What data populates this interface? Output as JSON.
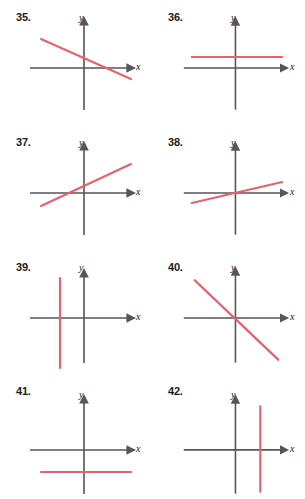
{
  "page": {
    "width": 305,
    "height": 499,
    "background": "#ffffff"
  },
  "style": {
    "line_color": "#e8606b",
    "axis_color": "#55555a",
    "text_color": "#1b1b1b",
    "axis_label_color": "#222222"
  },
  "axis_labels": {
    "x": "x",
    "y": "y"
  },
  "panels": [
    {
      "number": "35.",
      "col": 0,
      "row": 0,
      "origin": {
        "x": 84,
        "y": 68
      },
      "line_type": "oblique",
      "slope_sign": "negative",
      "line": {
        "x1": 41,
        "y1": 39,
        "x2": 131,
        "y2": 79
      }
    },
    {
      "number": "36.",
      "col": 1,
      "row": 0,
      "origin": {
        "x": 236,
        "y": 68
      },
      "line_type": "horizontal",
      "slope_sign": "zero",
      "line": {
        "x1": 192,
        "y1": 57,
        "x2": 283,
        "y2": 57
      }
    },
    {
      "number": "37.",
      "col": 0,
      "row": 1,
      "origin": {
        "x": 84,
        "y": 193
      },
      "line_type": "oblique",
      "slope_sign": "positive",
      "line": {
        "x1": 41,
        "y1": 206,
        "x2": 131,
        "y2": 164
      }
    },
    {
      "number": "38.",
      "col": 1,
      "row": 1,
      "origin": {
        "x": 236,
        "y": 193
      },
      "line_type": "oblique",
      "slope_sign": "positive-shallow",
      "line": {
        "x1": 192,
        "y1": 203,
        "x2": 283,
        "y2": 182
      }
    },
    {
      "number": "39.",
      "col": 0,
      "row": 2,
      "origin": {
        "x": 84,
        "y": 318
      },
      "line_type": "vertical",
      "slope_sign": "undefined",
      "line": {
        "x1": 60,
        "y1": 278,
        "x2": 60,
        "y2": 368
      }
    },
    {
      "number": "40.",
      "col": 1,
      "row": 2,
      "origin": {
        "x": 236,
        "y": 318
      },
      "line_type": "oblique",
      "slope_sign": "negative",
      "line": {
        "x1": 195,
        "y1": 280,
        "x2": 279,
        "y2": 360
      }
    },
    {
      "number": "41.",
      "col": 0,
      "row": 3,
      "origin": {
        "x": 84,
        "y": 450
      },
      "line_type": "horizontal",
      "slope_sign": "zero",
      "line": {
        "x1": 41,
        "y1": 472,
        "x2": 131,
        "y2": 472
      }
    },
    {
      "number": "42.",
      "col": 1,
      "row": 3,
      "origin": {
        "x": 236,
        "y": 450
      },
      "line_type": "vertical",
      "slope_sign": "undefined",
      "line": {
        "x1": 261,
        "y1": 406,
        "x2": 261,
        "y2": 492
      }
    }
  ]
}
